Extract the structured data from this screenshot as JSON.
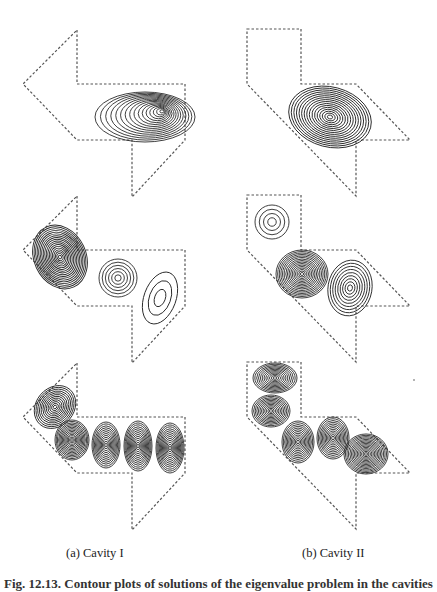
{
  "figure": {
    "subcaptions": {
      "a": "(a) Cavity I",
      "b": "(b) Cavity II"
    },
    "main_caption_clipped": "Fig. 12.13.  Contour plots of solutions of the eigenvalue problem in the cavities"
  },
  "style": {
    "boundary_color": "#555555",
    "contour_color": "#2a2a2a"
  },
  "cavities": [
    {
      "name": "Cavity I",
      "outline": [
        [
          77,
          30
        ],
        [
          77,
          84
        ],
        [
          185,
          84
        ],
        [
          185,
          140
        ],
        [
          132,
          197
        ],
        [
          132,
          140
        ],
        [
          77,
          140
        ],
        [
          23,
          84
        ]
      ],
      "row_offsets": [
        0,
        166,
        333
      ],
      "modes": [
        [
          {
            "cx": 145,
            "cy": 117,
            "rx": 50,
            "ry": 25,
            "rot": 0,
            "n": 16,
            "skew": "left-tail"
          }
        ],
        [
          {
            "cx": 60,
            "cy": 257,
            "rx": 26,
            "ry": 33,
            "rot": -25,
            "n": 18
          },
          {
            "cx": 118,
            "cy": 278,
            "rx": 19,
            "ry": 19,
            "rot": 0,
            "n": 6
          },
          {
            "cx": 160,
            "cy": 298,
            "rx": 16,
            "ry": 27,
            "rot": 20,
            "n": 3
          }
        ],
        [
          {
            "cx": 55,
            "cy": 407,
            "rx": 19,
            "ry": 23,
            "rot": 40,
            "n": 12
          },
          {
            "cx": 72,
            "cy": 440,
            "rx": 17,
            "ry": 20,
            "rot": 0,
            "n": 14
          },
          {
            "cx": 106,
            "cy": 445,
            "rx": 14,
            "ry": 23,
            "rot": 0,
            "n": 12
          },
          {
            "cx": 138,
            "cy": 446,
            "rx": 14,
            "ry": 25,
            "rot": 0,
            "n": 13
          },
          {
            "cx": 170,
            "cy": 448,
            "rx": 14,
            "ry": 25,
            "rot": 0,
            "n": 13
          }
        ]
      ]
    },
    {
      "name": "Cavity II",
      "outline": [
        [
          247,
          29
        ],
        [
          301,
          29
        ],
        [
          301,
          84
        ],
        [
          356,
          84
        ],
        [
          410,
          140
        ],
        [
          356,
          140
        ],
        [
          356,
          196
        ],
        [
          247,
          84
        ]
      ],
      "row_offsets": [
        0,
        166,
        333
      ],
      "modes": [
        [
          {
            "cx": 330,
            "cy": 117,
            "rx": 42,
            "ry": 30,
            "rot": 15,
            "n": 16
          }
        ],
        [
          {
            "cx": 272,
            "cy": 222,
            "rx": 17,
            "ry": 17,
            "rot": 0,
            "n": 4
          },
          {
            "cx": 302,
            "cy": 274,
            "rx": 26,
            "ry": 24,
            "rot": 0,
            "n": 16
          },
          {
            "cx": 350,
            "cy": 288,
            "rx": 22,
            "ry": 28,
            "rot": 10,
            "n": 9
          }
        ],
        [
          {
            "cx": 275,
            "cy": 378,
            "rx": 22,
            "ry": 15,
            "rot": 0,
            "n": 12
          },
          {
            "cx": 271,
            "cy": 411,
            "rx": 19,
            "ry": 16,
            "rot": 0,
            "n": 12
          },
          {
            "cx": 298,
            "cy": 442,
            "rx": 16,
            "ry": 21,
            "rot": 0,
            "n": 12
          },
          {
            "cx": 333,
            "cy": 438,
            "rx": 16,
            "ry": 21,
            "rot": 0,
            "n": 12
          },
          {
            "cx": 366,
            "cy": 454,
            "rx": 22,
            "ry": 20,
            "rot": 0,
            "n": 15
          }
        ]
      ]
    }
  ]
}
